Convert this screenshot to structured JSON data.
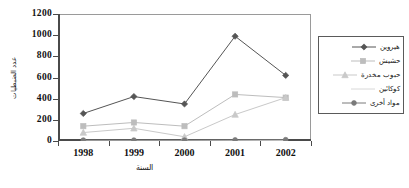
{
  "chart_data": {
    "type": "line",
    "title": "",
    "subtitle": "",
    "xlabel": "السنة",
    "ylabel": "عدد الضبطيات",
    "categories": [
      "1998",
      "1999",
      "2000",
      "2001",
      "2002"
    ],
    "x": [
      1998,
      1999,
      2000,
      2001,
      2002
    ],
    "ylim": [
      0,
      1200
    ],
    "yticks": [
      "0",
      "200",
      "400",
      "600",
      "800",
      "1000",
      "1200"
    ],
    "ytick_values": [
      0,
      200,
      400,
      600,
      800,
      1000,
      1200
    ],
    "grid": false,
    "legend_position": "right",
    "series": [
      {
        "name": "هيروين",
        "marker": "diamond",
        "color": "#555555",
        "values": [
          260,
          420,
          350,
          990,
          620
        ]
      },
      {
        "name": "حشيش",
        "marker": "square",
        "color": "#bdbdbd",
        "values": [
          140,
          175,
          140,
          440,
          410
        ]
      },
      {
        "name": "حبوب مخدرة",
        "marker": "triangle",
        "color": "#c9c9c9",
        "values": [
          80,
          120,
          40,
          250,
          410
        ]
      },
      {
        "name": "كوكائين",
        "marker": "none",
        "color": "#d8d8d8",
        "values": [
          5,
          5,
          5,
          5,
          5
        ]
      },
      {
        "name": "مواد أخرى",
        "marker": "circle",
        "color": "#7a7a7a",
        "values": [
          8,
          8,
          8,
          10,
          12
        ]
      }
    ]
  },
  "axis": {
    "x_title": "السنة",
    "y_title": "عدد الضبطيات",
    "x_tick_labels": [
      "1998",
      "1999",
      "2000",
      "2001",
      "2002"
    ],
    "y_tick_labels": [
      "1200",
      "1000",
      "800",
      "600",
      "400",
      "200",
      "0"
    ]
  },
  "legend": {
    "items": [
      {
        "label": "هيروين"
      },
      {
        "label": "حشيش"
      },
      {
        "label": "حبوب مخدرة"
      },
      {
        "label": "كوكائين"
      },
      {
        "label": "مواد أخرى"
      }
    ]
  },
  "colors": {
    "frame": "#9a9a9a",
    "axis": "#4a4a4a",
    "background": "#ffffff",
    "text": "#111111"
  }
}
